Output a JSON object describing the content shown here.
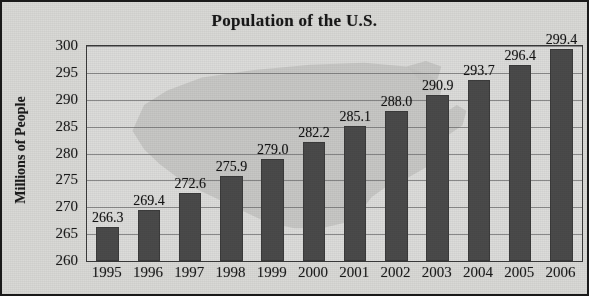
{
  "chart_data": {
    "type": "bar",
    "title": "Population of the U.S.",
    "xlabel": "",
    "ylabel": "Millions of People",
    "categories": [
      "1995",
      "1996",
      "1997",
      "1998",
      "1999",
      "2000",
      "2001",
      "2002",
      "2003",
      "2004",
      "2005",
      "2006"
    ],
    "values": [
      266.3,
      269.4,
      272.6,
      275.9,
      279.0,
      282.2,
      285.1,
      288.0,
      290.9,
      293.7,
      296.4,
      299.4
    ],
    "value_labels": [
      "266.3",
      "269.4",
      "272.6",
      "275.9",
      "279.0",
      "282.2",
      "285.1",
      "288.0",
      "290.9",
      "293.7",
      "296.4",
      "299.4"
    ],
    "ylim": [
      260,
      300
    ],
    "ytick_values": [
      300,
      295,
      290,
      285,
      280,
      275,
      270,
      265,
      260
    ],
    "ytick_labels": [
      "300",
      "295",
      "290",
      "285",
      "280",
      "275",
      "270",
      "265",
      "260"
    ],
    "grid": true,
    "legend": "none",
    "bar_color": "#4a4a4a",
    "background_color": "#d9d9d6",
    "text_color": "#1c1c1c",
    "gridline_color": "#6d6d6d",
    "watermark": "us-map-outline"
  }
}
